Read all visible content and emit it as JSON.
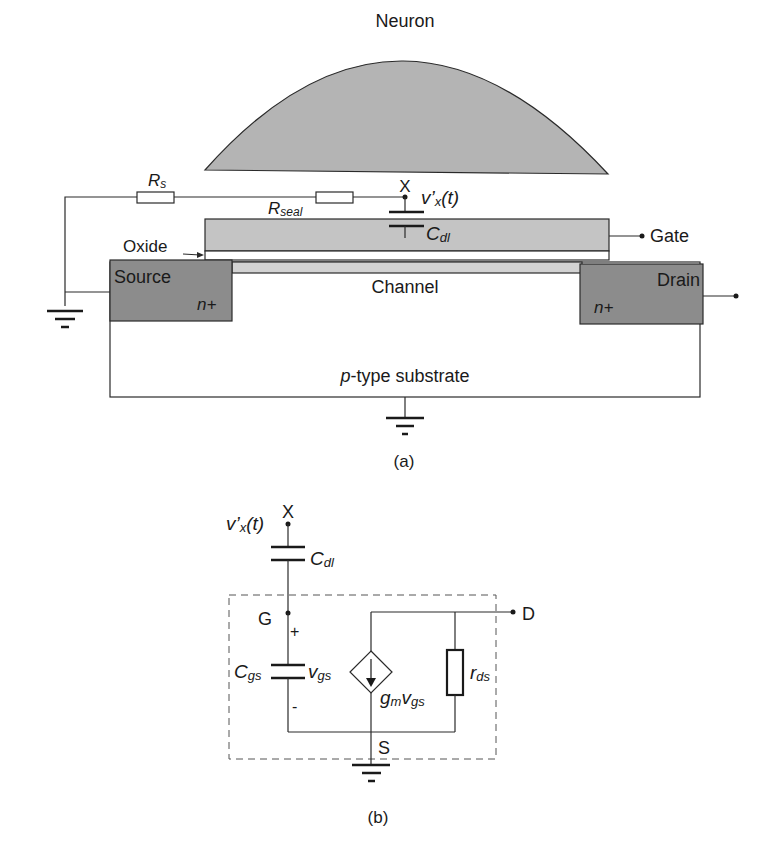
{
  "figure_a": {
    "neuron_label": "Neuron",
    "node_x": "X",
    "voltage_label": "v’",
    "voltage_sub": "x",
    "voltage_tail": "(t)",
    "rs_label": "R",
    "rs_sub": "s",
    "rseal_label": "R",
    "rseal_sub": "seal",
    "cdl_label": "C",
    "cdl_sub": "dl",
    "gate_label": "Gate",
    "oxide_label": "Oxide",
    "source_label": "Source",
    "source_doping": "n+",
    "drain_label": "Drain",
    "drain_doping": "n+",
    "channel_label": "Channel",
    "substrate_prefix": "p",
    "substrate_label": "-type substrate",
    "caption": "(a)"
  },
  "figure_b": {
    "node_x": "X",
    "voltage_label": "v’",
    "voltage_sub": "x",
    "voltage_tail": "(t)",
    "cdl_label": "C",
    "cdl_sub": "dl",
    "gate_node": "G",
    "drain_node": "D",
    "source_node": "S",
    "plus": "+",
    "minus": "-",
    "cgs_label": "C",
    "cgs_sub": "gs",
    "vgs_label": "v",
    "vgs_sub": "gs",
    "gm_label": "g",
    "gm_sub": "m",
    "gm_v": "v",
    "gm_vsub": "gs",
    "rds_label": "r",
    "rds_sub": "ds",
    "caption": "(b)"
  },
  "colors": {
    "neuron_fill": "#b4b4b4",
    "gate_fill": "#c4c4c4",
    "channel_fill": "#d2d2d2",
    "doped_fill": "#8c8c8c",
    "line": "#2a2a2a"
  }
}
